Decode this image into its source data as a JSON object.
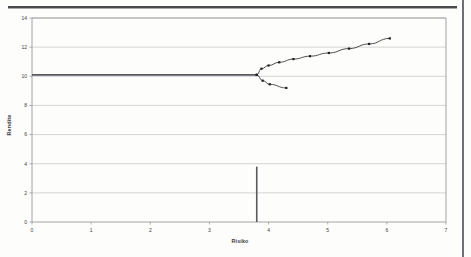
{
  "figure": {
    "name": "efficient-frontier-chart",
    "background": "#fdfdfc",
    "ink_color": "#3c3c3e",
    "grid_color": "#c9c9cc",
    "frame_color": "#9a9a9e"
  },
  "chart_data": {
    "type": "line",
    "title": "",
    "xlabel": "Risiko",
    "ylabel": "Rendite",
    "xlim": [
      0,
      7
    ],
    "ylim": [
      0,
      14
    ],
    "xticks": [
      0,
      1,
      2,
      3,
      4,
      5,
      6,
      7
    ],
    "yticks": [
      0,
      2,
      4,
      6,
      8,
      10,
      12,
      14
    ],
    "xtick_labels": [
      "0",
      "1",
      "2",
      "3",
      "4",
      "5",
      "6",
      "7"
    ],
    "ytick_labels": [
      "0",
      "2",
      "4",
      "6",
      "8",
      "10",
      "12",
      "14"
    ],
    "grid": "horizontal",
    "legend": "none",
    "series": [
      {
        "name": "efficient-frontier-upper",
        "marker": "square",
        "marker_color": "#1f1f22",
        "line_color": "#3c3c3e",
        "points": [
          [
            3.8,
            10.1
          ],
          [
            3.88,
            10.52
          ],
          [
            4.0,
            10.74
          ],
          [
            4.18,
            10.96
          ],
          [
            4.42,
            11.18
          ],
          [
            4.7,
            11.38
          ],
          [
            5.02,
            11.6
          ],
          [
            5.36,
            11.9
          ],
          [
            5.7,
            12.22
          ],
          [
            6.05,
            12.6
          ]
        ]
      },
      {
        "name": "inefficient-frontier-lower",
        "marker": "square",
        "marker_color": "#1f1f22",
        "line_color": "#3c3c3e",
        "points": [
          [
            3.8,
            10.1
          ],
          [
            3.9,
            9.7
          ],
          [
            4.02,
            9.45
          ],
          [
            4.3,
            9.2
          ]
        ]
      }
    ],
    "reference_lines": [
      {
        "name": "minimum-variance-horizontal",
        "orientation": "horizontal",
        "value": 10.1,
        "from": 0,
        "to": 3.8,
        "color": "#5a5a5e"
      },
      {
        "name": "minimum-variance-vertical",
        "orientation": "vertical",
        "value": 3.8,
        "from": 0,
        "to": 10.1,
        "color": "#5a5a5e"
      }
    ],
    "annotations": []
  }
}
